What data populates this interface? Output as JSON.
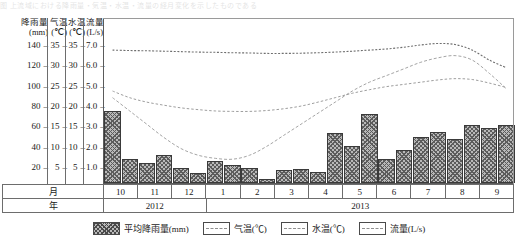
{
  "top_strip_text": "图 上流域における降雨量・気温・水温・流量の経月変化を示したものである",
  "axes": [
    {
      "name": "rainfall",
      "title_line1": "降雨量",
      "title_line2": "(mm)",
      "ticks": [
        "140",
        "120",
        "100",
        "80",
        "60",
        "40",
        "20"
      ],
      "unit": "mm"
    },
    {
      "name": "air-temp",
      "title_line1": "气温",
      "title_line2": "(℃)",
      "ticks": [
        "35",
        "30",
        "25",
        "20",
        "15",
        "10",
        "5"
      ],
      "unit": "℃"
    },
    {
      "name": "water-temp",
      "title_line1": "水温",
      "title_line2": "(℃)",
      "ticks": [
        "35",
        "30",
        "25",
        "20",
        "15",
        "10",
        "5"
      ],
      "unit": "℃"
    },
    {
      "name": "flow",
      "title_line1": "流量",
      "title_line2": "(L/s)",
      "ticks": [
        "7.0",
        "6.0",
        "5.0",
        "4.0",
        "3.0",
        "2.0",
        "1.0"
      ],
      "unit": "L/s"
    }
  ],
  "month_row_header": "月",
  "year_row_header": "年",
  "months": [
    "10",
    "11",
    "12",
    "1",
    "2",
    "3",
    "4",
    "5",
    "6",
    "7",
    "8",
    "9"
  ],
  "years": [
    {
      "label": "2012",
      "span_months": 3
    },
    {
      "label": "2013",
      "span_months": 9
    }
  ],
  "legend": [
    {
      "key": "rainfall",
      "label": "平均降雨量(mm)",
      "swatch": "hatch",
      "color": "#b9b9b9"
    },
    {
      "key": "air-temp",
      "label": "气温(℃)",
      "swatch": "dashed",
      "color": "#9a9a9a"
    },
    {
      "key": "water-temp",
      "label": "水温(℃)",
      "swatch": "dashed",
      "color": "#9a9a9a"
    },
    {
      "key": "flow",
      "label": "流量(L/s)",
      "swatch": "dashed",
      "color": "#8a8a8a"
    }
  ],
  "chart_data": {
    "type": "bar",
    "title": "",
    "xlabel": "月 / 年",
    "ylabel": "降雨量(mm)",
    "grid": false,
    "legend_position": "bottom",
    "categories": [
      "2012-10a",
      "2012-10b",
      "2012-11a",
      "2012-11b",
      "2012-12a",
      "2012-12b",
      "2013-1a",
      "2013-1b",
      "2013-2a",
      "2013-2b",
      "2013-3a",
      "2013-3b",
      "2013-4a",
      "2013-4b",
      "2013-5a",
      "2013-5b",
      "2013-6a",
      "2013-6b",
      "2013-7a",
      "2013-7b",
      "2013-8a",
      "2013-8b",
      "2013-9a",
      "2013-9b"
    ],
    "x_tick_labels": [
      "10",
      "11",
      "12",
      "1",
      "2",
      "3",
      "4",
      "5",
      "6",
      "7",
      "8",
      "9"
    ],
    "series": [
      {
        "name": "平均降雨量(mm)",
        "type": "bar",
        "axis": "rainfall",
        "ylim": [
          0,
          150
        ],
        "values": [
          65,
          22,
          18,
          25,
          14,
          9,
          20,
          16,
          14,
          4,
          12,
          13,
          10,
          45,
          33,
          62,
          22,
          30,
          42,
          46,
          40,
          52,
          50,
          52
        ]
      },
      {
        "name": "气温(℃)",
        "type": "line",
        "axis": "air-temp",
        "ylim": [
          0,
          37.5
        ],
        "values": [
          19.5,
          16.5,
          13.5,
          10.5,
          8.0,
          6.5,
          5.8,
          5.6,
          6.5,
          8.5,
          11.0,
          13.5,
          16.0,
          18.5,
          21.0,
          23.0,
          24.5,
          26.0,
          27.5,
          28.5,
          29.0,
          28.0,
          25.0,
          21.5
        ]
      },
      {
        "name": "水温(℃)",
        "type": "line",
        "axis": "water-temp",
        "ylim": [
          0,
          37.5
        ],
        "values": [
          21.0,
          19.5,
          18.5,
          17.8,
          17.2,
          16.8,
          16.5,
          16.4,
          16.4,
          16.6,
          17.0,
          17.6,
          18.5,
          19.5,
          20.5,
          21.3,
          22.0,
          22.5,
          23.0,
          23.5,
          23.8,
          23.6,
          22.8,
          21.8
        ]
      },
      {
        "name": "流量(L/s)",
        "type": "line",
        "axis": "flow",
        "ylim": [
          0,
          7.5
        ],
        "values": [
          6.05,
          6.03,
          6.02,
          6.0,
          5.98,
          5.96,
          5.95,
          5.93,
          5.92,
          5.9,
          5.9,
          5.91,
          5.93,
          5.96,
          6.0,
          6.05,
          6.1,
          6.18,
          6.28,
          6.35,
          6.3,
          6.05,
          5.6,
          5.25
        ]
      }
    ]
  }
}
